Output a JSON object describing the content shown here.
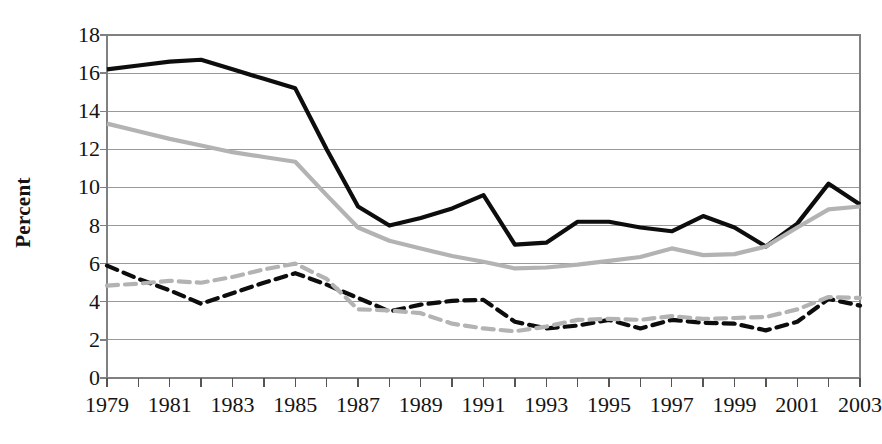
{
  "chart_data": {
    "type": "line",
    "title": "",
    "xlabel": "",
    "ylabel": "Percent",
    "x": [
      1979,
      1980,
      1981,
      1982,
      1983,
      1984,
      1985,
      1986,
      1987,
      1988,
      1989,
      1990,
      1991,
      1992,
      1993,
      1994,
      1995,
      1996,
      1997,
      1998,
      1999,
      2000,
      2001,
      2002,
      2003
    ],
    "xlim": [
      1979,
      2003
    ],
    "ylim": [
      0,
      18
    ],
    "ytick_values": [
      0,
      2,
      4,
      6,
      8,
      10,
      12,
      14,
      16,
      18
    ],
    "ytick_labels": [
      "0",
      "2",
      "4",
      "6",
      "8",
      "10",
      "12",
      "14",
      "16",
      "18"
    ],
    "xtick_values": [
      1979,
      1981,
      1983,
      1985,
      1987,
      1989,
      1991,
      1993,
      1995,
      1997,
      1999,
      2001,
      2003
    ],
    "xtick_labels": [
      "1979",
      "1981",
      "1983",
      "1985",
      "1987",
      "1989",
      "1991",
      "1993",
      "1995",
      "1997",
      "1999",
      "2001",
      "2003"
    ],
    "minor_xticks_every": 1,
    "grid": "horizontal",
    "grid_color": "#999999",
    "legend": "none",
    "plot_background": "#ffffff",
    "border_color": "#808080",
    "series": [
      {
        "name": "solid-black",
        "style": "solid",
        "color": "#0d0d0d",
        "width": 4.2,
        "values": [
          16.2,
          16.4,
          16.6,
          16.7,
          16.2,
          15.7,
          15.2,
          12.0,
          9.0,
          8.0,
          8.4,
          8.9,
          9.6,
          7.0,
          7.1,
          8.2,
          8.2,
          7.9,
          7.7,
          8.5,
          7.9,
          6.9,
          8.1,
          10.2,
          9.1
        ]
      },
      {
        "name": "solid-gray",
        "style": "solid",
        "color": "#b3b3b3",
        "width": 4.2,
        "values": [
          13.35,
          12.95,
          12.55,
          12.2,
          11.85,
          11.6,
          11.35,
          9.6,
          7.9,
          7.2,
          6.8,
          6.4,
          6.1,
          5.75,
          5.8,
          5.95,
          6.15,
          6.35,
          6.8,
          6.45,
          6.5,
          6.9,
          7.9,
          8.85,
          9.0
        ]
      },
      {
        "name": "dashed-black",
        "style": "dashed",
        "color": "#0d0d0d",
        "width": 4.2,
        "values": [
          5.9,
          5.2,
          4.6,
          3.9,
          4.45,
          5.0,
          5.5,
          4.9,
          4.2,
          3.5,
          3.85,
          4.05,
          4.1,
          2.95,
          2.6,
          2.75,
          3.05,
          2.6,
          3.05,
          2.9,
          2.85,
          2.5,
          2.95,
          4.15,
          3.8
        ]
      },
      {
        "name": "dashed-gray",
        "style": "dashed",
        "color": "#b3b3b3",
        "width": 4.2,
        "values": [
          4.85,
          4.95,
          5.1,
          5.0,
          5.3,
          5.7,
          6.0,
          5.2,
          3.6,
          3.55,
          3.4,
          2.85,
          2.6,
          2.45,
          2.7,
          3.05,
          3.1,
          3.05,
          3.25,
          3.1,
          3.15,
          3.2,
          3.6,
          4.25,
          4.2
        ]
      }
    ]
  },
  "layout": {
    "plot_left": 107,
    "plot_right": 860,
    "plot_top": 35,
    "plot_bottom": 378
  }
}
